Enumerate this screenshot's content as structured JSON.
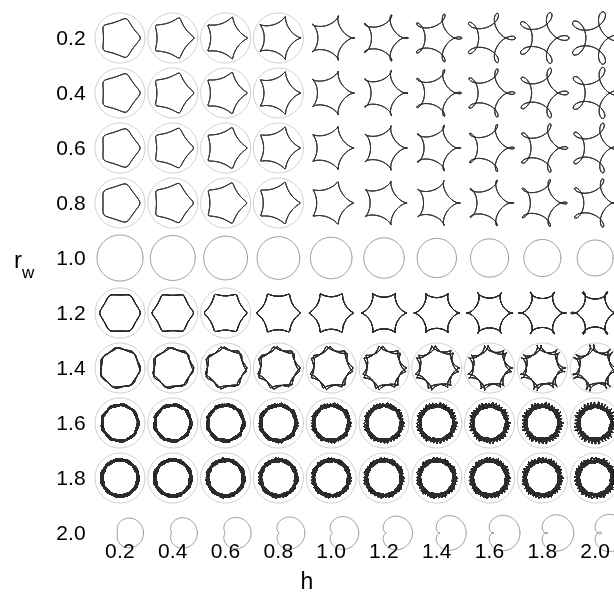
{
  "figure": {
    "background": "#ffffff",
    "line_color": "#2b2b2b",
    "width": 614,
    "height": 606
  },
  "axes": {
    "xlabel": "h",
    "ylabel_base": "r",
    "ylabel_sub": "w"
  },
  "chart_data": {
    "type": "scatter",
    "title": "",
    "subtitle": "",
    "xlabel": "h",
    "ylabel": "r_w",
    "grid": false,
    "legend": null,
    "x": [
      0.2,
      0.4,
      0.6,
      0.8,
      1.0,
      1.2,
      1.4,
      1.6,
      1.8,
      2.0
    ],
    "y": [
      0.2,
      0.4,
      0.6,
      0.8,
      1.0,
      1.2,
      1.4,
      1.6,
      1.8,
      2.0
    ],
    "xticklabels": [
      "0.2",
      "0.4",
      "0.6",
      "0.8",
      "1.0",
      "1.2",
      "1.4",
      "1.6",
      "1.8",
      "2.0"
    ],
    "yticklabels": [
      "0.2",
      "0.4",
      "0.6",
      "0.8",
      "1.0",
      "1.2",
      "1.4",
      "1.6",
      "1.8",
      "2.0"
    ],
    "xlim": [
      0.1,
      2.1
    ],
    "ylim": [
      0.1,
      2.1
    ],
    "panel_count": 100,
    "cells": [
      {
        "row": 0,
        "rw": 0.2,
        "panels": [
          {
            "h": 0.2,
            "lobes": 5,
            "style": "rounded-pentagon-in-circle"
          },
          {
            "h": 0.4,
            "lobes": 5,
            "style": "looped-pentagon"
          },
          {
            "h": 0.6,
            "lobes": 5,
            "style": "petal-rosette"
          },
          {
            "h": 0.8,
            "lobes": 5,
            "style": "petal-rosette"
          },
          {
            "h": 1.0,
            "lobes": 5,
            "style": "overlapping-rosette"
          },
          {
            "h": 1.2,
            "lobes": 5,
            "style": "overlapping-rosette"
          },
          {
            "h": 1.4,
            "lobes": 5,
            "style": "overlapping-rosette"
          },
          {
            "h": 1.6,
            "lobes": 5,
            "style": "wide-rosette"
          },
          {
            "h": 1.8,
            "lobes": 5,
            "style": "wide-rosette"
          },
          {
            "h": 2.0,
            "lobes": 5,
            "style": "wide-rosette"
          }
        ]
      },
      {
        "row": 1,
        "rw": 0.4,
        "panels": [
          {
            "h": 0.2,
            "lobes": 5,
            "style": "star-in-circle"
          },
          {
            "h": 0.4,
            "lobes": 5,
            "style": "pentagram"
          },
          {
            "h": 0.6,
            "lobes": 5,
            "style": "pinwheel"
          },
          {
            "h": 0.8,
            "lobes": 5,
            "style": "petal-rosette"
          },
          {
            "h": 1.0,
            "lobes": 5,
            "style": "petal-rosette"
          },
          {
            "h": 1.2,
            "lobes": 5,
            "style": "petal-rosette"
          },
          {
            "h": 1.4,
            "lobes": 5,
            "style": "petal-rosette"
          },
          {
            "h": 1.6,
            "lobes": 5,
            "style": "wide-rosette"
          },
          {
            "h": 1.8,
            "lobes": 5,
            "style": "wide-rosette"
          },
          {
            "h": 2.0,
            "lobes": 5,
            "style": "wide-rosette"
          }
        ]
      },
      {
        "row": 2,
        "rw": 0.6,
        "panels": [
          {
            "h": 0.2,
            "lobes": 5,
            "style": "small-rosette-in-circle"
          },
          {
            "h": 0.4,
            "lobes": 5,
            "style": "propeller"
          },
          {
            "h": 0.6,
            "lobes": 5,
            "style": "star"
          },
          {
            "h": 0.8,
            "lobes": 5,
            "style": "star"
          },
          {
            "h": 1.0,
            "lobes": 5,
            "style": "star"
          },
          {
            "h": 1.2,
            "lobes": 5,
            "style": "blunt-star"
          },
          {
            "h": 1.4,
            "lobes": 5,
            "style": "blunt-star"
          },
          {
            "h": 1.6,
            "lobes": 5,
            "style": "rounded-star"
          },
          {
            "h": 1.8,
            "lobes": 5,
            "style": "rounded-star"
          },
          {
            "h": 2.0,
            "lobes": 5,
            "style": "rounded-star"
          }
        ]
      },
      {
        "row": 3,
        "rw": 0.8,
        "panels": [
          {
            "h": 0.2,
            "lobes": 5,
            "style": "tiny-flower-in-circle"
          },
          {
            "h": 0.4,
            "lobes": 5,
            "style": "small-flower-in-circle"
          },
          {
            "h": 0.6,
            "lobes": 5,
            "style": "cusped-pentagon"
          },
          {
            "h": 0.8,
            "lobes": 5,
            "style": "cusped-pentagon"
          },
          {
            "h": 1.0,
            "lobes": 5,
            "style": "pentagon"
          },
          {
            "h": 1.2,
            "lobes": 5,
            "style": "pentagon"
          },
          {
            "h": 1.4,
            "lobes": 5,
            "style": "pentagon"
          },
          {
            "h": 1.6,
            "lobes": 5,
            "style": "pentagon"
          },
          {
            "h": 1.8,
            "lobes": 5,
            "style": "pentagon"
          },
          {
            "h": 2.0,
            "lobes": 5,
            "style": "pentagon"
          }
        ]
      },
      {
        "row": 4,
        "rw": 1.0,
        "panels": [
          {
            "h": 0.2,
            "lobes": 0,
            "style": "circle"
          },
          {
            "h": 0.4,
            "lobes": 0,
            "style": "circle"
          },
          {
            "h": 0.6,
            "lobes": 0,
            "style": "circle"
          },
          {
            "h": 0.8,
            "lobes": 0,
            "style": "circle"
          },
          {
            "h": 1.0,
            "lobes": 0,
            "style": "circle"
          },
          {
            "h": 1.2,
            "lobes": 0,
            "style": "circle"
          },
          {
            "h": 1.4,
            "lobes": 0,
            "style": "circle"
          },
          {
            "h": 1.6,
            "lobes": 0,
            "style": "circle"
          },
          {
            "h": 1.8,
            "lobes": 0,
            "style": "circle"
          },
          {
            "h": 2.0,
            "lobes": 0,
            "style": "circle"
          }
        ]
      },
      {
        "row": 5,
        "rw": 1.2,
        "panels": [
          {
            "h": 0.2,
            "lobes": 6,
            "style": "tiny-rosette-in-circle"
          },
          {
            "h": 0.4,
            "lobes": 6,
            "style": "looped-flower"
          },
          {
            "h": 0.6,
            "lobes": 6,
            "style": "looped-flower"
          },
          {
            "h": 0.8,
            "lobes": 6,
            "style": "cloud-flower"
          },
          {
            "h": 1.0,
            "lobes": 6,
            "style": "cloud-flower"
          },
          {
            "h": 1.2,
            "lobes": 6,
            "style": "cloud-flower"
          },
          {
            "h": 1.4,
            "lobes": 6,
            "style": "cloud-flower"
          },
          {
            "h": 1.6,
            "lobes": 6,
            "style": "cloud-flower"
          },
          {
            "h": 1.8,
            "lobes": 6,
            "style": "cloud-flower"
          },
          {
            "h": 2.0,
            "lobes": 6,
            "style": "cloud-flower"
          }
        ]
      },
      {
        "row": 6,
        "rw": 1.4,
        "panels": [
          {
            "h": 0.2,
            "lobes": 7,
            "style": "concentric-rosette"
          },
          {
            "h": 0.4,
            "lobes": 7,
            "style": "dense-rosette"
          },
          {
            "h": 0.6,
            "lobes": 7,
            "style": "loop-rosette"
          },
          {
            "h": 0.8,
            "lobes": 7,
            "style": "loop-rosette"
          },
          {
            "h": 1.0,
            "lobes": 7,
            "style": "loop-rosette"
          },
          {
            "h": 1.2,
            "lobes": 7,
            "style": "loop-rosette"
          },
          {
            "h": 1.4,
            "lobes": 7,
            "style": "loop-rosette"
          },
          {
            "h": 1.6,
            "lobes": 7,
            "style": "loop-rosette"
          },
          {
            "h": 1.8,
            "lobes": 7,
            "style": "loop-rosette"
          },
          {
            "h": 2.0,
            "lobes": 7,
            "style": "loop-rosette"
          }
        ]
      },
      {
        "row": 7,
        "rw": 1.6,
        "panels": [
          {
            "h": 0.2,
            "lobes": 9,
            "style": "thick-annulus"
          },
          {
            "h": 0.4,
            "lobes": 9,
            "style": "dense-spiro"
          },
          {
            "h": 0.6,
            "lobes": 9,
            "style": "dense-spiro"
          },
          {
            "h": 0.8,
            "lobes": 9,
            "style": "dense-spiro"
          },
          {
            "h": 1.0,
            "lobes": 9,
            "style": "dense-spiro"
          },
          {
            "h": 1.2,
            "lobes": 9,
            "style": "dense-spiro"
          },
          {
            "h": 1.4,
            "lobes": 9,
            "style": "dense-spiro"
          },
          {
            "h": 1.6,
            "lobes": 9,
            "style": "dense-spiro"
          },
          {
            "h": 1.8,
            "lobes": 9,
            "style": "dense-spiro"
          },
          {
            "h": 2.0,
            "lobes": 9,
            "style": "dense-spiro"
          }
        ]
      },
      {
        "row": 8,
        "rw": 1.8,
        "panels": [
          {
            "h": 0.2,
            "lobes": 11,
            "style": "very-thick-annulus"
          },
          {
            "h": 0.4,
            "lobes": 11,
            "style": "very-dense-spiro"
          },
          {
            "h": 0.6,
            "lobes": 11,
            "style": "very-dense-spiro"
          },
          {
            "h": 0.8,
            "lobes": 11,
            "style": "very-dense-spiro"
          },
          {
            "h": 1.0,
            "lobes": 11,
            "style": "very-dense-spiro"
          },
          {
            "h": 1.2,
            "lobes": 11,
            "style": "very-dense-spiro"
          },
          {
            "h": 1.4,
            "lobes": 11,
            "style": "very-dense-spiro"
          },
          {
            "h": 1.6,
            "lobes": 11,
            "style": "very-dense-spiro"
          },
          {
            "h": 1.8,
            "lobes": 11,
            "style": "very-dense-spiro"
          },
          {
            "h": 2.0,
            "lobes": 11,
            "style": "very-dense-spiro"
          }
        ]
      },
      {
        "row": 9,
        "rw": 2.0,
        "panels": [
          {
            "h": 0.2,
            "lobes": 1,
            "style": "limacon"
          },
          {
            "h": 0.4,
            "lobes": 1,
            "style": "limacon"
          },
          {
            "h": 0.6,
            "lobes": 1,
            "style": "limacon"
          },
          {
            "h": 0.8,
            "lobes": 1,
            "style": "limacon"
          },
          {
            "h": 1.0,
            "lobes": 1,
            "style": "limacon"
          },
          {
            "h": 1.2,
            "lobes": 1,
            "style": "limacon"
          },
          {
            "h": 1.4,
            "lobes": 1,
            "style": "limacon"
          },
          {
            "h": 1.6,
            "lobes": 1,
            "style": "limacon"
          },
          {
            "h": 1.8,
            "lobes": 1,
            "style": "limacon"
          },
          {
            "h": 2.0,
            "lobes": 1,
            "style": "limacon"
          }
        ]
      }
    ]
  },
  "layout": {
    "cell_origin_x": 120,
    "cell_origin_y": 38,
    "cell_step_x": 52.8,
    "cell_step_y": 55.0,
    "cell_radius": 25
  }
}
